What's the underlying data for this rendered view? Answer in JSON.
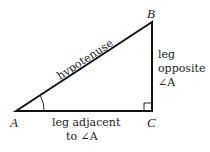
{
  "diagram": {
    "vertices": {
      "A": "A",
      "B": "B",
      "C": "C"
    },
    "labels": {
      "hypotenuse": "hypotenuse",
      "opposite_line1": "leg",
      "opposite_line2": "opposite",
      "opposite_line3": "∠A",
      "adjacent_line1": "leg adjacent",
      "adjacent_line2": "to ∠A"
    },
    "colors": {
      "stroke": "#111111",
      "text": "#222222"
    }
  }
}
